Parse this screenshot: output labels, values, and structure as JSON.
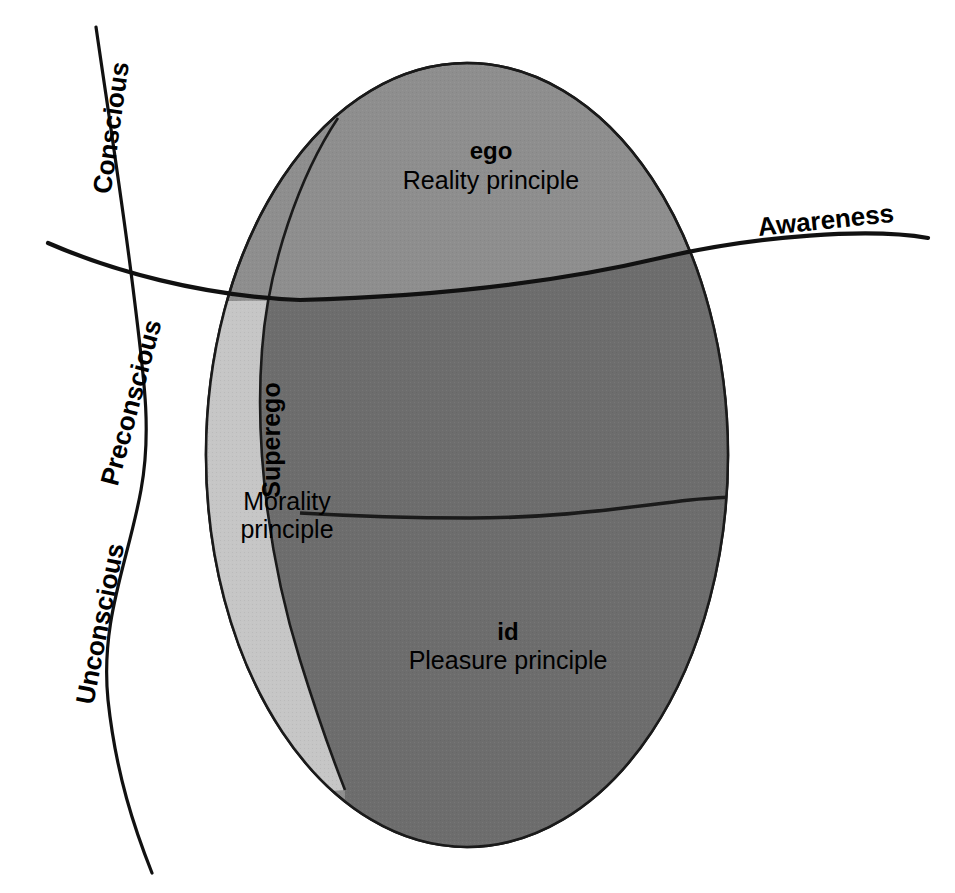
{
  "diagram": {
    "type": "conceptual-diagram",
    "background_color": "#ffffff",
    "line_color": "#111111"
  },
  "awareness": {
    "label": "Awareness",
    "bold": true
  },
  "consciousness_levels": [
    {
      "id": "conscious",
      "label": "Conscious",
      "bold": true,
      "orientation": "rotated-along-curve"
    },
    {
      "id": "preconscious",
      "label": "Preconscious",
      "bold": true,
      "orientation": "rotated-along-curve"
    },
    {
      "id": "unconscious",
      "label": "Unconscious",
      "bold": true,
      "orientation": "rotated-along-curve"
    }
  ],
  "psyche_regions": [
    {
      "id": "ego",
      "name": "ego",
      "name_bold": true,
      "principle_line1": "Reality principle",
      "principle_line2": "",
      "orientation": "horizontal",
      "fill_above_awareness": "#8e8e8e",
      "fill_below_awareness": "#6d6d6d"
    },
    {
      "id": "superego",
      "name": "Superego",
      "name_bold": true,
      "principle_line1": "Morality",
      "principle_line2": "principle",
      "orientation": "rotated-vertical",
      "fill_above_awareness": "#8e8e8e",
      "fill_below_awareness": "#c6c6c6"
    },
    {
      "id": "id",
      "name": "id",
      "name_bold": true,
      "principle_line1": "Pleasure principle",
      "principle_line2": "",
      "orientation": "horizontal",
      "fill_above_awareness": "",
      "fill_below_awareness": "#6d6d6d"
    }
  ],
  "palette": {
    "medium_gray": "#8e8e8e",
    "light_gray": "#c6c6c6",
    "dark_gray": "#6d6d6d",
    "outline": "#1a1a1a",
    "white": "#ffffff"
  }
}
